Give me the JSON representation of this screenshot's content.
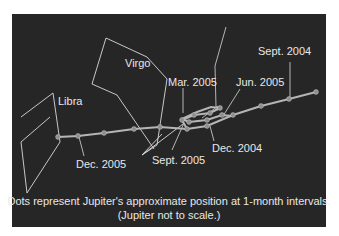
{
  "diagram": {
    "colors": {
      "background": "#262626",
      "lines": "#d9d9d9",
      "dots": "#9a9a9a",
      "text": "#e8e8e8",
      "page": "#ffffff"
    },
    "constellations": [
      {
        "name": "Libra"
      },
      {
        "name": "Virgo"
      }
    ],
    "date_labels": [
      {
        "label": "Sept. 2004"
      },
      {
        "label": "Dec. 2004"
      },
      {
        "label": "Mar. 2005"
      },
      {
        "label": "Jun. 2005"
      },
      {
        "label": "Sept. 2005"
      },
      {
        "label": "Dec. 2005"
      }
    ],
    "caption": {
      "line1": "Dots represent Jupiter's approximate position at 1-month intervals.",
      "line2": "(Jupiter not to scale.)"
    }
  }
}
